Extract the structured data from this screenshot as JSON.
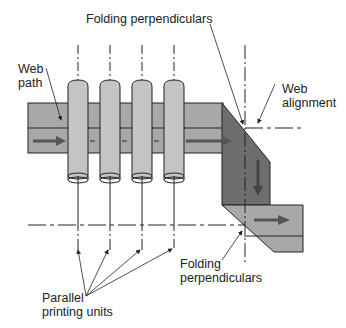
{
  "diagram": {
    "type": "printing-press web path schematic",
    "labels": {
      "folding_top": "Folding perpendiculars",
      "web_path_line1": "Web",
      "web_path_line2": "path",
      "web_alignment_line1": "Web",
      "web_alignment_line2": "alignment",
      "folding_bottom_line1": "Folding",
      "folding_bottom_line2": "perpendiculars",
      "units_line1": "Parallel",
      "units_line2": "printing units"
    },
    "printing_unit_count": 4,
    "colors": {
      "web_light": "#a8a8a8",
      "web_dark": "#6e6e6e",
      "cylinder": "#c4c4c4",
      "arrow": "#555555",
      "line": "#222222"
    }
  }
}
